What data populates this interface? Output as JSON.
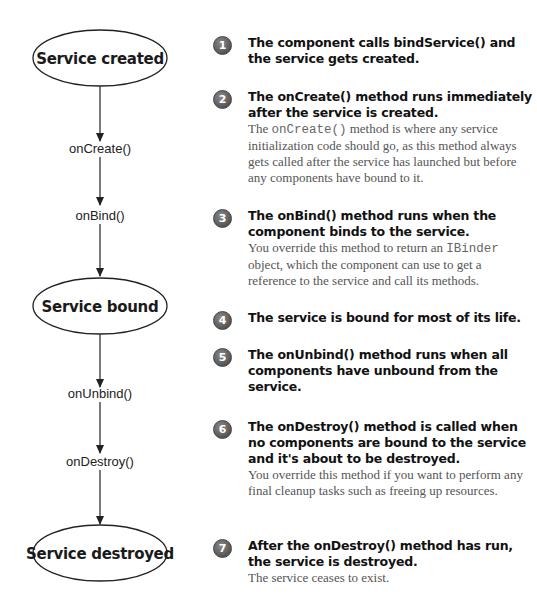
{
  "states": [
    {
      "id": "created",
      "label": "Service created"
    },
    {
      "id": "bound",
      "label": "Service bound"
    },
    {
      "id": "destroyed",
      "label": "Service destroyed"
    }
  ],
  "methods": [
    {
      "label": "onCreate()"
    },
    {
      "label": "onBind()"
    },
    {
      "label": "onUnbind()"
    },
    {
      "label": "onDestroy()"
    }
  ],
  "steps": [
    {
      "number": "1",
      "heading": "The component calls bindService() and the service gets created."
    },
    {
      "number": "2",
      "heading": "The onCreate() method runs immediately after the service is created.",
      "desc_pre": "The ",
      "desc_code": "onCreate()",
      "desc_post": " method is where any service initialization code should go, as this method always gets called after the service has launched but before any components have bound to it."
    },
    {
      "number": "3",
      "heading": "The onBind() method runs when the component binds to the service.",
      "desc_pre": "You override this method to return an ",
      "desc_code": "IBinder",
      "desc_post": " object, which the component can use to get a reference to the service and call its methods."
    },
    {
      "number": "4",
      "heading": "The service is bound for most of its life."
    },
    {
      "number": "5",
      "heading": "The onUnbind() method runs when all components have unbound from the service."
    },
    {
      "number": "6",
      "heading": "The onDestroy() method is called when no components are bound to the service and it's about to be destroyed.",
      "desc": "You override this method if you want to perform any final cleanup tasks such as freeing up resources."
    },
    {
      "number": "7",
      "heading": "After the onDestroy() method has run, the service is destroyed.",
      "desc": "The service ceases to exist."
    }
  ]
}
